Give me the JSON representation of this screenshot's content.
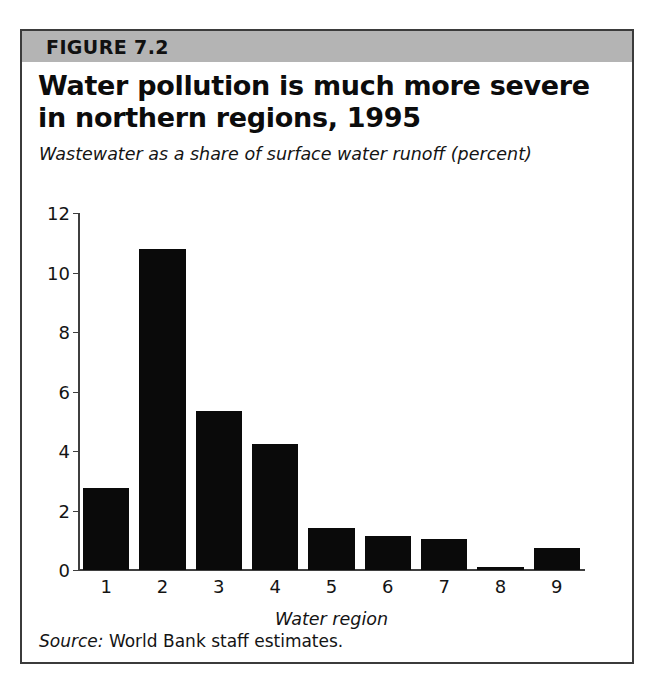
{
  "figure": {
    "number_label": "FIGURE 7.2",
    "title": "Water pollution is much more severe in northern regions, 1995",
    "subtitle": "Wastewater as a share of surface water runoff (percent)",
    "source_label": "Source:",
    "source_text": "World Bank staff estimates.",
    "band_color": "#b4b4b4",
    "frame_color": "#3b3b3b",
    "bar_color": "#0a0a0a"
  },
  "chart_data": {
    "type": "bar",
    "title": "Water pollution is much more severe in northern regions, 1995",
    "subtitle": "Wastewater as a share of surface water runoff (percent)",
    "xlabel": "Water region",
    "ylabel": "",
    "categories": [
      "1",
      "2",
      "3",
      "4",
      "5",
      "6",
      "7",
      "8",
      "9"
    ],
    "values": [
      2.75,
      10.8,
      5.35,
      4.25,
      1.4,
      1.15,
      1.05,
      0.1,
      0.75
    ],
    "ylim": [
      0,
      12
    ],
    "yticks": [
      0,
      2,
      4,
      6,
      8,
      10,
      12
    ],
    "ytick_labels": [
      "0",
      "2",
      "4",
      "6",
      "8",
      "10",
      "12"
    ],
    "grid": false,
    "legend": false,
    "series": [
      {
        "name": "Wastewater as a share of surface water runoff (percent)",
        "values": [
          2.75,
          10.8,
          5.35,
          4.25,
          1.4,
          1.15,
          1.05,
          0.1,
          0.75
        ]
      }
    ]
  }
}
